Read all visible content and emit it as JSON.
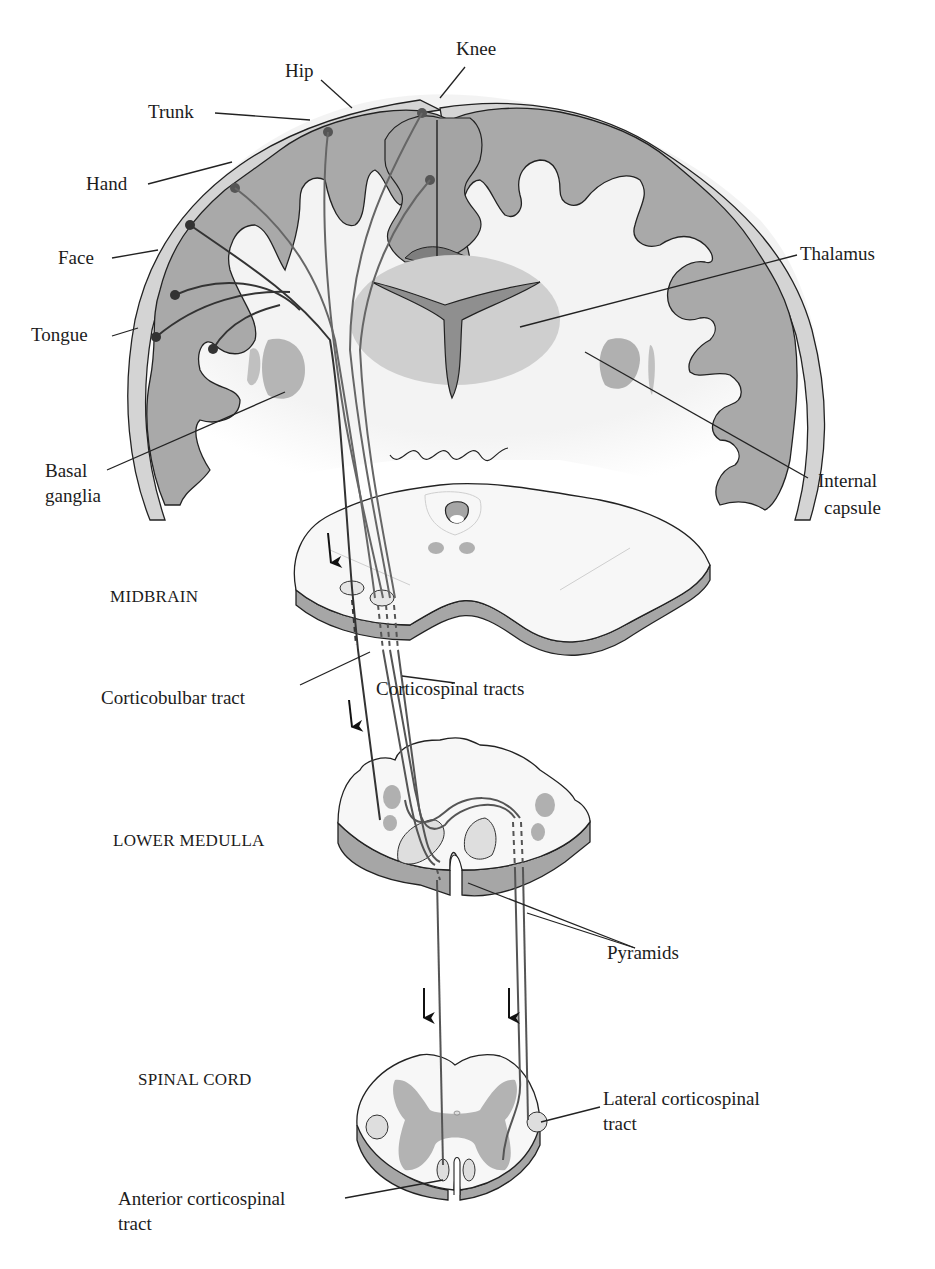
{
  "figure": {
    "type": "anatomical diagram"
  },
  "colors": {
    "background": "#ffffff",
    "cortex_gray_matter": "#a9a9a9",
    "cortex_pia": "#d6d6d6",
    "white_matter": "#f4f4f4",
    "thalamus": "#cfcfcf",
    "ventricle": "#8c8c8c",
    "section_side": "#a6a6a6",
    "section_top": "#f7f7f7",
    "tract_line": "#555555",
    "neuron_dot": "#4a4a4a",
    "outline": "#222222"
  },
  "labels": {
    "hip": "Hip",
    "knee": "Knee",
    "trunk": "Trunk",
    "hand": "Hand",
    "face": "Face",
    "tongue": "Tongue",
    "thalamus": "Thalamus",
    "basal_ganglia_1": "Basal",
    "basal_ganglia_2": "ganglia",
    "internal_capsule_1": "Internal",
    "internal_capsule_2": "capsule",
    "midbrain": "MIDBRAIN",
    "corticobulbar_tract": "Corticobulbar tract",
    "corticospinal_tracts": "Corticospinal tracts",
    "lower_medulla": "LOWER MEDULLA",
    "pyramids": "Pyramids",
    "spinal_cord": "SPINAL CORD",
    "lateral_corticospinal_1": "Lateral corticospinal",
    "lateral_corticospinal_2": "tract",
    "anterior_corticospinal_1": "Anterior corticospinal",
    "anterior_corticospinal_2": "tract"
  },
  "levels": [
    "Cerebral cortex (coronal section)",
    "MIDBRAIN",
    "LOWER MEDULLA",
    "SPINAL CORD"
  ],
  "somatotopy": [
    "Knee",
    "Hip",
    "Trunk",
    "Hand",
    "Face",
    "Tongue"
  ],
  "arrows": {
    "direction": "down",
    "count": 4
  }
}
